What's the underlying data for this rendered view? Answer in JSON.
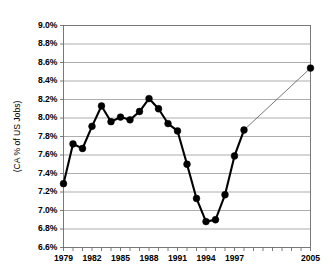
{
  "chart_data": {
    "type": "line",
    "title": "",
    "xlabel": "",
    "ylabel": "(CA % of US Jobs)",
    "ylim": [
      6.6,
      9.0
    ],
    "xlim": [
      1979,
      2005
    ],
    "ytick_step": 0.2,
    "grid": true,
    "legend": null,
    "y_tick_labels": [
      "9.0%",
      "8.8%",
      "8.6%",
      "8.4%",
      "8.2%",
      "8.0%",
      "7.8%",
      "7.6%",
      "7.4%",
      "7.2%",
      "7.0%",
      "6.8%",
      "6.6%"
    ],
    "y_tick_values": [
      9.0,
      8.8,
      8.6,
      8.4,
      8.2,
      8.0,
      7.8,
      7.6,
      7.4,
      7.2,
      7.0,
      6.8,
      6.6
    ],
    "x_tick_labels": [
      "1979",
      "1982",
      "1985",
      "1988",
      "1991",
      "1994",
      "1997",
      "2005"
    ],
    "x_tick_values": [
      1979,
      1982,
      1985,
      1988,
      1991,
      1994,
      1997,
      2005
    ],
    "x_minor_ticks": [
      1979,
      1980,
      1981,
      1982,
      1983,
      1984,
      1985,
      1986,
      1987,
      1988,
      1989,
      1990,
      1991,
      1992,
      1993,
      1994,
      1995,
      1996,
      1997,
      1998,
      1999,
      2000,
      2001,
      2002,
      2003,
      2004,
      2005
    ],
    "x": [
      1979,
      1980,
      1981,
      1982,
      1983,
      1984,
      1985,
      1986,
      1987,
      1988,
      1989,
      1990,
      1991,
      1992,
      1993,
      1994,
      1995,
      1996,
      1997,
      1998,
      2005
    ],
    "values": [
      7.29,
      7.72,
      7.67,
      7.91,
      8.13,
      7.96,
      8.01,
      7.98,
      8.07,
      8.21,
      8.1,
      7.94,
      7.86,
      7.5,
      7.13,
      6.88,
      6.9,
      7.17,
      7.59,
      7.87,
      8.54
    ],
    "series": [
      {
        "name": "CA % of US Jobs",
        "values": [
          7.29,
          7.72,
          7.67,
          7.91,
          8.13,
          7.96,
          8.01,
          7.98,
          8.07,
          8.21,
          8.1,
          7.94,
          7.86,
          7.5,
          7.13,
          6.88,
          6.9,
          7.17,
          7.59,
          7.87,
          8.54
        ]
      }
    ],
    "projection_segment": {
      "from_x": 1998,
      "from_y": 7.87,
      "to_x": 2005,
      "to_y": 8.54,
      "style": "thin-line"
    },
    "colors": {
      "line": "#000000",
      "marker": "#000000",
      "gridline": "#8a8a8a",
      "frame": "#6b6b6b",
      "background": "#ffffff"
    }
  }
}
